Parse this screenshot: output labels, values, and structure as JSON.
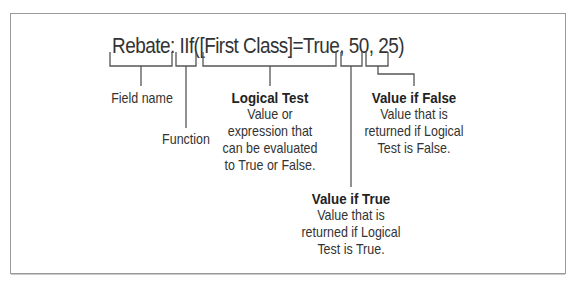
{
  "diagram": {
    "expression": "Rebate: IIf([First Class]=True, 50, 25)",
    "parts": [
      {
        "id": "field",
        "text": "Rebate:"
      },
      {
        "id": "function",
        "text": "IIf("
      },
      {
        "id": "logical_test",
        "text": "[First Class]=True"
      },
      {
        "id": "value_if_true",
        "text": "50"
      },
      {
        "id": "value_if_false",
        "text": "25)"
      }
    ],
    "labels": {
      "field_name": {
        "title": "Field name"
      },
      "function": {
        "title": "Function"
      },
      "logical_test": {
        "title": "Logical Test",
        "lines": [
          "Value or",
          "expression that",
          "can be evaluated",
          "to True or False."
        ]
      },
      "value_if_true": {
        "title": "Value if True",
        "lines": [
          "Value that is",
          "returned if Logical",
          "Test is True."
        ]
      },
      "value_if_false": {
        "title": "Value if False",
        "lines": [
          "Value that is",
          "returned if Logical",
          "Test is False."
        ]
      }
    },
    "colors": {
      "text": "#333333",
      "lines": "#555555",
      "frame": "#9a9a9a",
      "background": "#ffffff"
    }
  }
}
